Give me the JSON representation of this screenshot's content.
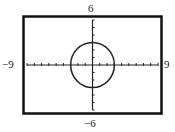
{
  "chart_data": {
    "type": "line",
    "title": "",
    "equation": "x^2 + y^2 = 9",
    "series": [
      {
        "name": "circle",
        "shape": "circle",
        "center": [
          0,
          0
        ],
        "radius": 3
      }
    ],
    "xlim": [
      -9,
      9
    ],
    "ylim": [
      -6,
      6
    ],
    "xscale": 1,
    "yscale": 1,
    "grid": false,
    "tick_labels": {
      "xmin": "−9",
      "xmax": "9",
      "ymin": "−6",
      "ymax": "6"
    },
    "xlabel": "",
    "ylabel": ""
  },
  "window": {
    "top_label": "6",
    "bottom_label": "−6",
    "left_label": "−9",
    "right_label": "9"
  }
}
